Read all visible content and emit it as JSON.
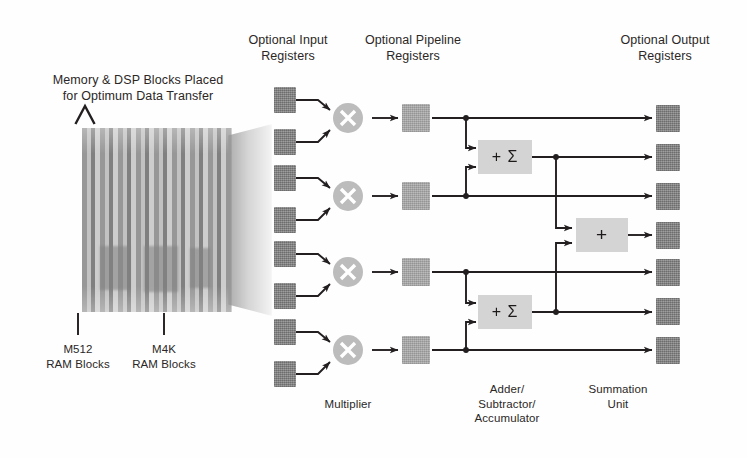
{
  "diagram": {
    "headers": {
      "input_registers": "Optional Input\nRegisters",
      "pipeline_registers": "Optional Pipeline\nRegisters",
      "output_registers": "Optional Output\nRegisters"
    },
    "left_annotation": "Memory & DSP Blocks Placed\nfor Optimum Data Transfer",
    "memory_labels": [
      {
        "text": "M512\nRAM Blocks",
        "x": 46,
        "y": 348
      },
      {
        "text": "M4K\nRAM Blocks",
        "x": 131,
        "y": 348
      }
    ],
    "bottom_labels": {
      "multiplier": "Multiplier",
      "adder": "Adder/\nSubtractor/\nAccumulator",
      "summation": "Summation\nUnit"
    },
    "block_symbols": {
      "multiplier": "×",
      "adder": "+ Σ",
      "summation": "+"
    },
    "counts": {
      "input_registers": 8,
      "multipliers": 4,
      "pipeline_registers": 4,
      "adders": 2,
      "summation_units": 1,
      "output_registers": 7
    },
    "colors": {
      "register_dark": "#8a8a8a",
      "register_mid": "#adadad",
      "block_fill": "#d4d4d4",
      "multiplier_fill": "#bcbcbc",
      "wire": "#231f20",
      "text": "#2b2726",
      "background": "#ffffff"
    }
  }
}
